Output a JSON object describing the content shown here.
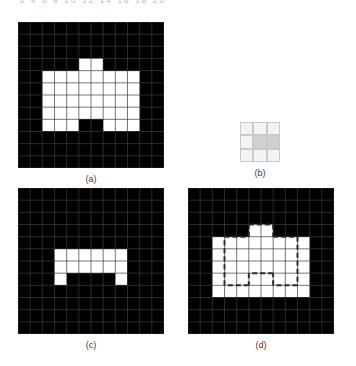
{
  "figure": {
    "header_numbers": "2  4  6  8  10   12  14  16  18  20",
    "grid_cols": 12,
    "grid_rows": 12,
    "colors": {
      "foreground": "#ffffff",
      "background": "#000000",
      "gridline": "#3c3c3c",
      "se_light": "#f3f3f3",
      "se_shade": "#d0d0d0",
      "se_border": "#c9c9c9",
      "caption": "#3a3a3a",
      "dash": "#2b2b2b"
    }
  },
  "panels": [
    {
      "id": "a",
      "caption": "(a)",
      "role": "original-binary-image",
      "cols": 12,
      "rows": 12,
      "comment": "1 = white foreground pixel, 0 = black background pixel",
      "matrix": [
        [
          0,
          0,
          0,
          0,
          0,
          0,
          0,
          0,
          0,
          0,
          0,
          0
        ],
        [
          0,
          0,
          0,
          0,
          0,
          0,
          0,
          0,
          0,
          0,
          0,
          0
        ],
        [
          0,
          0,
          0,
          0,
          0,
          0,
          0,
          0,
          0,
          0,
          0,
          0
        ],
        [
          0,
          0,
          0,
          0,
          0,
          1,
          1,
          0,
          0,
          0,
          0,
          0
        ],
        [
          0,
          0,
          1,
          1,
          1,
          1,
          1,
          1,
          1,
          1,
          0,
          0
        ],
        [
          0,
          0,
          1,
          1,
          1,
          1,
          1,
          1,
          1,
          1,
          0,
          0
        ],
        [
          0,
          0,
          1,
          1,
          1,
          1,
          1,
          1,
          1,
          1,
          0,
          0
        ],
        [
          0,
          0,
          1,
          1,
          1,
          1,
          1,
          1,
          1,
          1,
          0,
          0
        ],
        [
          0,
          0,
          1,
          1,
          1,
          0,
          0,
          1,
          1,
          1,
          0,
          0
        ],
        [
          0,
          0,
          0,
          0,
          0,
          0,
          0,
          0,
          0,
          0,
          0,
          0
        ],
        [
          0,
          0,
          0,
          0,
          0,
          0,
          0,
          0,
          0,
          0,
          0,
          0
        ],
        [
          0,
          0,
          0,
          0,
          0,
          0,
          0,
          0,
          0,
          0,
          0,
          0
        ]
      ]
    },
    {
      "id": "b",
      "caption": "(b)",
      "role": "structuring-element",
      "cols": 3,
      "rows": 3,
      "comment": "2 = shaded (element member / origin), 1 = light cell",
      "matrix": [
        [
          1,
          1,
          1
        ],
        [
          1,
          2,
          2
        ],
        [
          1,
          1,
          1
        ]
      ]
    },
    {
      "id": "c",
      "caption": "(c)",
      "role": "eroded-image",
      "cols": 12,
      "rows": 12,
      "matrix": [
        [
          0,
          0,
          0,
          0,
          0,
          0,
          0,
          0,
          0,
          0,
          0,
          0
        ],
        [
          0,
          0,
          0,
          0,
          0,
          0,
          0,
          0,
          0,
          0,
          0,
          0
        ],
        [
          0,
          0,
          0,
          0,
          0,
          0,
          0,
          0,
          0,
          0,
          0,
          0
        ],
        [
          0,
          0,
          0,
          0,
          0,
          0,
          0,
          0,
          0,
          0,
          0,
          0
        ],
        [
          0,
          0,
          0,
          0,
          0,
          0,
          0,
          0,
          0,
          0,
          0,
          0
        ],
        [
          0,
          0,
          0,
          1,
          1,
          1,
          1,
          1,
          1,
          0,
          0,
          0
        ],
        [
          0,
          0,
          0,
          1,
          1,
          1,
          1,
          1,
          1,
          0,
          0,
          0
        ],
        [
          0,
          0,
          0,
          1,
          0,
          0,
          0,
          0,
          1,
          0,
          0,
          0
        ],
        [
          0,
          0,
          0,
          0,
          0,
          0,
          0,
          0,
          0,
          0,
          0,
          0
        ],
        [
          0,
          0,
          0,
          0,
          0,
          0,
          0,
          0,
          0,
          0,
          0,
          0
        ],
        [
          0,
          0,
          0,
          0,
          0,
          0,
          0,
          0,
          0,
          0,
          0,
          0
        ],
        [
          0,
          0,
          0,
          0,
          0,
          0,
          0,
          0,
          0,
          0,
          0,
          0
        ]
      ]
    },
    {
      "id": "d",
      "caption": "(d)",
      "role": "original-with-erosion-outline",
      "cols": 12,
      "rows": 12,
      "matrix": [
        [
          0,
          0,
          0,
          0,
          0,
          0,
          0,
          0,
          0,
          0,
          0,
          0
        ],
        [
          0,
          0,
          0,
          0,
          0,
          0,
          0,
          0,
          0,
          0,
          0,
          0
        ],
        [
          0,
          0,
          0,
          0,
          0,
          0,
          0,
          0,
          0,
          0,
          0,
          0
        ],
        [
          0,
          0,
          0,
          0,
          0,
          1,
          1,
          0,
          0,
          0,
          0,
          0
        ],
        [
          0,
          0,
          1,
          1,
          1,
          1,
          1,
          1,
          1,
          1,
          0,
          0
        ],
        [
          0,
          0,
          1,
          1,
          1,
          1,
          1,
          1,
          1,
          1,
          0,
          0
        ],
        [
          0,
          0,
          1,
          1,
          1,
          1,
          1,
          1,
          1,
          1,
          0,
          0
        ],
        [
          0,
          0,
          1,
          1,
          1,
          1,
          1,
          1,
          1,
          1,
          0,
          0
        ],
        [
          0,
          0,
          1,
          1,
          1,
          1,
          1,
          1,
          1,
          1,
          0,
          0
        ],
        [
          0,
          0,
          0,
          0,
          0,
          0,
          0,
          0,
          0,
          0,
          0,
          0
        ],
        [
          0,
          0,
          0,
          0,
          0,
          0,
          0,
          0,
          0,
          0,
          0,
          0
        ],
        [
          0,
          0,
          0,
          0,
          0,
          0,
          0,
          0,
          0,
          0,
          0,
          0
        ]
      ],
      "outline_segments": [
        {
          "x1": 3,
          "y1": 4,
          "x2": 5,
          "y2": 4
        },
        {
          "x1": 5,
          "y1": 4,
          "x2": 5,
          "y2": 3
        },
        {
          "x1": 5,
          "y1": 3,
          "x2": 7,
          "y2": 3
        },
        {
          "x1": 7,
          "y1": 3,
          "x2": 7,
          "y2": 4
        },
        {
          "x1": 7,
          "y1": 4,
          "x2": 9,
          "y2": 4
        },
        {
          "x1": 9,
          "y1": 4,
          "x2": 9,
          "y2": 8
        },
        {
          "x1": 9,
          "y1": 8,
          "x2": 7,
          "y2": 8
        },
        {
          "x1": 7,
          "y1": 8,
          "x2": 7,
          "y2": 7
        },
        {
          "x1": 7,
          "y1": 7,
          "x2": 5,
          "y2": 7
        },
        {
          "x1": 5,
          "y1": 7,
          "x2": 5,
          "y2": 8
        },
        {
          "x1": 5,
          "y1": 8,
          "x2": 3,
          "y2": 8
        },
        {
          "x1": 3,
          "y1": 8,
          "x2": 3,
          "y2": 4
        }
      ]
    }
  ]
}
